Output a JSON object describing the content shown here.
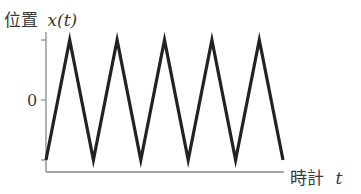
{
  "chart_data": {
    "type": "line",
    "title": "",
    "ylabel": "位置",
    "ylabel_var": "x(t)",
    "xlabel": "時計",
    "xlabel_var": "t",
    "y_tick_labels": [
      "0"
    ],
    "y_ticks": [
      1,
      0,
      -1
    ],
    "grid": false,
    "legend": null,
    "series": [
      {
        "name": "x(t)",
        "shape": "triangle wave",
        "x": [
          0,
          0.5,
          1,
          1.5,
          2,
          2.5,
          3,
          3.5,
          4,
          4.5,
          5
        ],
        "values": [
          -1,
          1,
          -1,
          1,
          -1,
          1,
          -1,
          1,
          -1,
          1,
          -1
        ]
      }
    ],
    "xlim": [
      0,
      5
    ],
    "ylim": [
      -1.2,
      1.05
    ]
  },
  "labels": {
    "y_axis_name": "位置",
    "y_axis_var": "x(t)",
    "x_axis_name": "時計",
    "x_axis_var": "t",
    "zero": "0"
  },
  "colors": {
    "axis": "#888888",
    "line": "#222222",
    "text": "#3a3a3a"
  }
}
